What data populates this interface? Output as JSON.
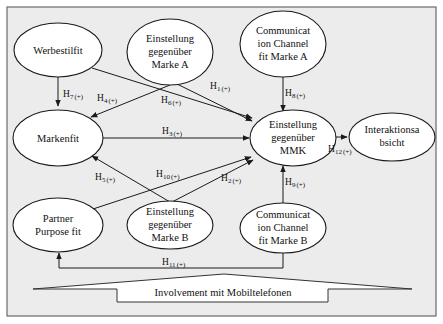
{
  "diagram": {
    "nodes": {
      "werbestilfit": {
        "lines": [
          "Werbestilfit"
        ]
      },
      "einstellung_marke_a": {
        "lines": [
          "Einstellung",
          "gegenüber",
          "Marke A"
        ]
      },
      "cc_fit_marke_a": {
        "lines": [
          "Communicat",
          "ion Channel",
          "fit Marke A"
        ]
      },
      "markenfit": {
        "lines": [
          "Markenfit"
        ]
      },
      "einstellung_mmk": {
        "lines": [
          "Einstellung",
          "gegenüber",
          "MMK"
        ]
      },
      "interaktionsabsicht": {
        "lines": [
          "Interaktionsa",
          "bsicht"
        ]
      },
      "partner_purpose_fit": {
        "lines": [
          "Partner",
          "Purpose fit"
        ]
      },
      "einstellung_marke_b": {
        "lines": [
          "Einstellung",
          "gegenüber",
          "Marke B"
        ]
      },
      "cc_fit_marke_b": {
        "lines": [
          "Communicat",
          "ion Channel",
          "fit Marke B"
        ]
      }
    },
    "hypotheses": {
      "h1": {
        "main": "H",
        "num": "1",
        "sign": "(+)",
        "from": "Einstellung gegenüber Marke A",
        "to": "Einstellung gegenüber MMK"
      },
      "h2": {
        "main": "H",
        "num": "2",
        "sign": "(+)",
        "from": "Einstellung gegenüber Marke B",
        "to": "Einstellung gegenüber MMK"
      },
      "h3": {
        "main": "H",
        "num": "3",
        "sign": "(+)",
        "from": "Markenfit",
        "to": "Einstellung gegenüber MMK"
      },
      "h4": {
        "main": "H",
        "num": "4",
        "sign": "(+)",
        "from": "Einstellung gegenüber Marke A",
        "to": "Markenfit"
      },
      "h5": {
        "main": "H",
        "num": "5",
        "sign": "(+)",
        "from": "Einstellung gegenüber Marke B",
        "to": "Markenfit"
      },
      "h6": {
        "main": "H",
        "num": "6",
        "sign": "(+)",
        "from": "Werbestilfit",
        "to": "Einstellung gegenüber MMK"
      },
      "h7": {
        "main": "H",
        "num": "7",
        "sign": "(+)",
        "from": "Werbestilfit",
        "to": "Markenfit"
      },
      "h8": {
        "main": "H",
        "num": "8",
        "sign": "(+)",
        "from": "Communication Channel fit Marke A",
        "to": "Einstellung gegenüber MMK"
      },
      "h9": {
        "main": "H",
        "num": "9",
        "sign": "(+)",
        "from": "Communication Channel fit Marke B",
        "to": "Einstellung gegenüber MMK"
      },
      "h10": {
        "main": "H",
        "num": "10",
        "sign": "(+)",
        "from": "Partner Purpose fit",
        "to": "Einstellung gegenüber MMK"
      },
      "h11": {
        "main": "H",
        "num": "11",
        "sign": "(+)",
        "from": "Communication Channel fit Marke B",
        "to": "Partner Purpose fit"
      },
      "h12": {
        "main": "H",
        "num": "12",
        "sign": "(+)",
        "from": "Einstellung gegenüber MMK",
        "to": "Interaktionsabsicht"
      }
    },
    "moderator": {
      "label": "Involvement mit Mobiltelefonen"
    },
    "colors": {
      "background": "#ececec",
      "frame": "#6a6a6a",
      "node_fill": "#ffffff",
      "stroke": "#1a1a1a"
    }
  }
}
